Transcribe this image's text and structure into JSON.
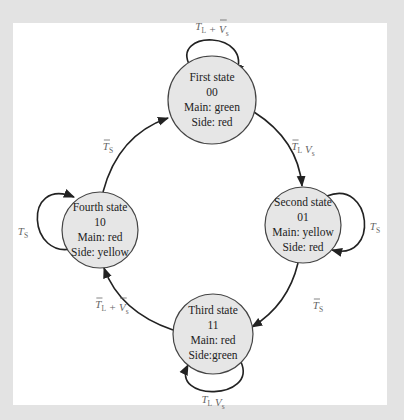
{
  "colors": {
    "frame": "#e3e3e3",
    "panel": "#ffffff",
    "state_fill": "#e6e6e6",
    "edge": "#222222",
    "label": "#666666"
  },
  "states": [
    {
      "id": "first",
      "name": "First state",
      "code": "00",
      "main": "Main: green",
      "side": "Side: red",
      "cx": 212,
      "cy": 100,
      "r": 44
    },
    {
      "id": "second",
      "name": "Second state",
      "code": "01",
      "main": "Main: yellow",
      "side": "Side: red",
      "cx": 303,
      "cy": 225,
      "r": 38
    },
    {
      "id": "third",
      "name": "Third state",
      "code": "11",
      "main": "Main: red",
      "side": "Side:green",
      "cx": 213,
      "cy": 334,
      "r": 40
    },
    {
      "id": "fourth",
      "name": "Fourth state",
      "code": "10",
      "main": "Main: red",
      "side": "Side: yellow",
      "cx": 100,
      "cy": 230,
      "r": 38
    }
  ],
  "transitions": [
    {
      "from": "first",
      "to": "first",
      "label": "T_L + V̄_s",
      "label_parts": [
        {
          "t": "T",
          "bar": false,
          "sub": "L"
        },
        {
          "t": " + "
        },
        {
          "t": "V",
          "bar": true,
          "sub": "s"
        }
      ]
    },
    {
      "from": "first",
      "to": "second",
      "label": "T̄_L V_s",
      "label_parts": [
        {
          "t": "T",
          "bar": true,
          "sub": "L"
        },
        {
          "t": " "
        },
        {
          "t": "V",
          "bar": false,
          "sub": "s"
        }
      ]
    },
    {
      "from": "second",
      "to": "second",
      "label": "T_S",
      "label_parts": [
        {
          "t": "T",
          "bar": false,
          "sub": "S"
        }
      ]
    },
    {
      "from": "second",
      "to": "third",
      "label": "T̄_S",
      "label_parts": [
        {
          "t": "T",
          "bar": true,
          "sub": "S"
        }
      ]
    },
    {
      "from": "third",
      "to": "third",
      "label": "T_L V_s",
      "label_parts": [
        {
          "t": "T",
          "bar": false,
          "sub": "L"
        },
        {
          "t": " "
        },
        {
          "t": "V",
          "bar": false,
          "sub": "s"
        }
      ]
    },
    {
      "from": "third",
      "to": "fourth",
      "label": "T̄_L + V̄_s",
      "label_parts": [
        {
          "t": "T",
          "bar": true,
          "sub": "L"
        },
        {
          "t": " + "
        },
        {
          "t": "V",
          "bar": true,
          "sub": "s"
        }
      ]
    },
    {
      "from": "fourth",
      "to": "fourth",
      "label": "T_S",
      "label_parts": [
        {
          "t": "T",
          "bar": false,
          "sub": "S"
        }
      ]
    },
    {
      "from": "fourth",
      "to": "first",
      "label": "T̄_S",
      "label_parts": [
        {
          "t": "T",
          "bar": true,
          "sub": "S"
        }
      ]
    }
  ]
}
